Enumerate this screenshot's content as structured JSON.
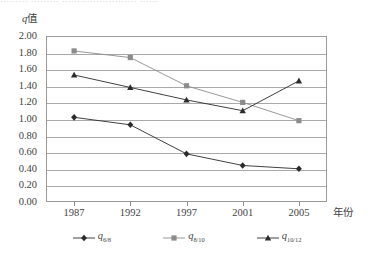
{
  "top_clipped_text": "………  ………  ……………………  ……",
  "axes": {
    "y_caption": "q值",
    "y_caption_symbol": "q",
    "y_caption_suffix": "值",
    "x_caption": "年份"
  },
  "legend": {
    "items": [
      {
        "name": "series-q-6-8",
        "symbol": "q",
        "subscript": "6/8",
        "marker": "diamond",
        "color": "#2b2b2b"
      },
      {
        "name": "series-q-8-10",
        "symbol": "q",
        "subscript": "8/10",
        "marker": "square",
        "color": "#8c8c8c"
      },
      {
        "name": "series-q-10-12",
        "symbol": "q",
        "subscript": "10/12",
        "marker": "triangle",
        "color": "#2b2b2b"
      }
    ]
  },
  "chart_data": {
    "type": "line",
    "title": "",
    "xlabel": "年份",
    "ylabel": "q值",
    "categories": [
      "1987",
      "1992",
      "1997",
      "2001",
      "2005"
    ],
    "x": [
      1987,
      1992,
      1997,
      2001,
      2005
    ],
    "ylim": [
      0.0,
      2.0
    ],
    "ytick_step": 0.2,
    "yticks": [
      "2.00",
      "1.80",
      "1.60",
      "1.40",
      "1.20",
      "1.00",
      "0.80",
      "0.60",
      "0.40",
      "0.20",
      "0.00"
    ],
    "grid": true,
    "legend_position": "bottom",
    "series": [
      {
        "name": "q_6/8",
        "marker": "diamond",
        "color": "#2b2b2b",
        "values": [
          1.02,
          0.93,
          0.58,
          0.44,
          0.4
        ]
      },
      {
        "name": "q_8/10",
        "marker": "square",
        "color": "#8c8c8c",
        "values": [
          1.82,
          1.74,
          1.4,
          1.2,
          0.98
        ]
      },
      {
        "name": "q_10/12",
        "marker": "triangle",
        "color": "#2b2b2b",
        "values": [
          1.53,
          1.38,
          1.23,
          1.1,
          1.46
        ]
      }
    ]
  }
}
